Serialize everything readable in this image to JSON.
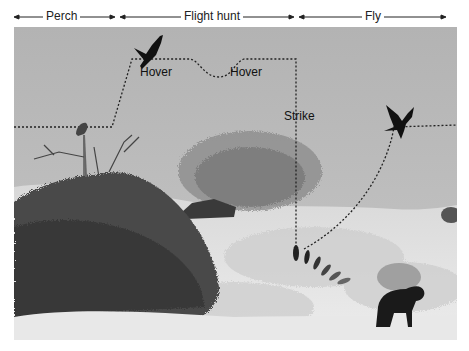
{
  "phases": [
    {
      "label": "Perch",
      "x1": 14,
      "x2": 115,
      "label_x": 44
    },
    {
      "label": "Flight hunt",
      "x1": 120,
      "x2": 294,
      "label_x": 183
    },
    {
      "label": "Fly",
      "x1": 299,
      "x2": 446,
      "label_x": 364
    }
  ],
  "annotations": {
    "hover1": "Hover",
    "hover2": "Hover",
    "strike": "Strike"
  },
  "colors": {
    "sky": "#b9b9b9",
    "path": "#222222",
    "silhouette": "#111111",
    "grass": "#e4e4e4"
  },
  "scene": {
    "subjects": [
      "perched-bird",
      "hovering-bird",
      "flying-bird",
      "grasshopper-prey",
      "baboon"
    ],
    "vegetation": [
      "thorn-bush",
      "acacia-tree",
      "grass-field"
    ]
  }
}
